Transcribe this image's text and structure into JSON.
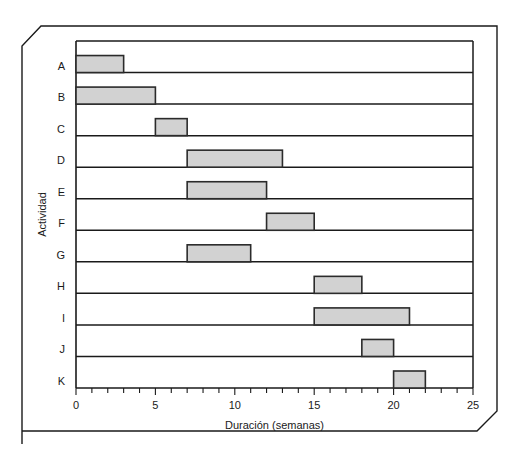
{
  "chart_data": {
    "type": "bar",
    "orientation": "horizontal",
    "subtype": "gantt",
    "title": "",
    "xlabel": "Duración (semanas)",
    "ylabel": "Actividad",
    "xlim": [
      0,
      25
    ],
    "ylim_categories": [
      "A",
      "B",
      "C",
      "D",
      "E",
      "F",
      "G",
      "H",
      "I",
      "J",
      "K"
    ],
    "categories": [
      "A",
      "B",
      "C",
      "D",
      "E",
      "F",
      "G",
      "H",
      "I",
      "J",
      "K"
    ],
    "xticks": [
      0,
      5,
      10,
      15,
      20,
      25
    ],
    "xtick_labels": [
      "0",
      "5",
      "10",
      "15",
      "20",
      "25"
    ],
    "minor_tick_step": 1,
    "grid": false,
    "legend": "none",
    "bar_fill_color": "#d2d2d2",
    "bar_edge_color": "#2b2b2b",
    "tasks": [
      {
        "activity": "A",
        "start": 0,
        "end": 3,
        "duration": 3
      },
      {
        "activity": "B",
        "start": 0,
        "end": 5,
        "duration": 5
      },
      {
        "activity": "C",
        "start": 5,
        "end": 7,
        "duration": 2
      },
      {
        "activity": "D",
        "start": 7,
        "end": 13,
        "duration": 6
      },
      {
        "activity": "E",
        "start": 7,
        "end": 12,
        "duration": 5
      },
      {
        "activity": "F",
        "start": 12,
        "end": 15,
        "duration": 3
      },
      {
        "activity": "G",
        "start": 7,
        "end": 11,
        "duration": 4
      },
      {
        "activity": "H",
        "start": 15,
        "end": 18,
        "duration": 3
      },
      {
        "activity": "I",
        "start": 15,
        "end": 21,
        "duration": 6
      },
      {
        "activity": "J",
        "start": 18,
        "end": 20,
        "duration": 2
      },
      {
        "activity": "K",
        "start": 20,
        "end": 22,
        "duration": 2
      }
    ]
  }
}
